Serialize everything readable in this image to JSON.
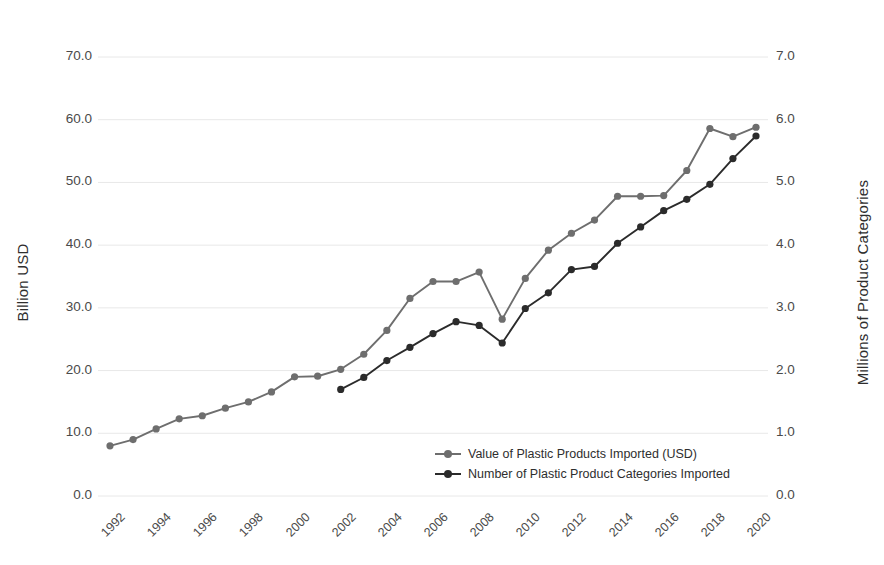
{
  "chart_data": {
    "type": "line",
    "title": "",
    "xlabel": "",
    "ylabel": "Billion USD",
    "y2label": "Millions of Product Categories",
    "grid": true,
    "legend_position": "inside-bottom-center",
    "x": [
      1992,
      1993,
      1994,
      1995,
      1996,
      1997,
      1998,
      1999,
      2000,
      2001,
      2002,
      2003,
      2004,
      2005,
      2006,
      2007,
      2008,
      2009,
      2010,
      2011,
      2012,
      2013,
      2014,
      2015,
      2016,
      2017,
      2018,
      2019,
      2020
    ],
    "xtick_labels": [
      "1992",
      "1994",
      "1996",
      "1998",
      "2000",
      "2002",
      "2004",
      "2006",
      "2008",
      "2010",
      "2012",
      "2014",
      "2016",
      "2018",
      "2020"
    ],
    "ytick_labels": [
      "0.0",
      "10.0",
      "20.0",
      "30.0",
      "40.0",
      "50.0",
      "60.0",
      "70.0"
    ],
    "y2tick_labels": [
      "0.0",
      "1.0",
      "2.0",
      "3.0",
      "4.0",
      "5.0",
      "6.0",
      "7.0"
    ],
    "ylim": [
      0,
      70
    ],
    "y2lim": [
      0,
      7
    ],
    "xlim": [
      1992,
      2020
    ],
    "series": [
      {
        "name": "Value of Plastic Products Imported (USD)",
        "axis": "left",
        "color": "#6e6e6e",
        "values": [
          8.0,
          9.0,
          10.7,
          12.3,
          12.8,
          14.0,
          15.0,
          16.6,
          19.0,
          19.1,
          20.2,
          22.6,
          26.4,
          31.5,
          34.2,
          34.2,
          35.7,
          28.2,
          34.7,
          39.2,
          41.9,
          44.0,
          47.8,
          47.8,
          47.9,
          51.9,
          58.6,
          57.3,
          58.8
        ]
      },
      {
        "name": "Number of Plastic Product Categories Imported",
        "axis": "right",
        "color": "#2b2b2b",
        "values": [
          null,
          null,
          null,
          null,
          null,
          null,
          null,
          null,
          null,
          null,
          1.7,
          1.89,
          2.16,
          2.37,
          2.59,
          2.78,
          2.72,
          2.44,
          2.99,
          3.24,
          3.61,
          3.66,
          4.03,
          4.29,
          4.55,
          4.73,
          4.97,
          5.38,
          5.74
        ]
      }
    ]
  },
  "axes": {
    "left_title": "Billion USD",
    "right_title": "Millions of Product Categories"
  },
  "legend": {
    "items": [
      {
        "label": "Value of Plastic Products Imported (USD)",
        "color": "#6e6e6e"
      },
      {
        "label": "Number of Plastic Product Categories Imported",
        "color": "#2b2b2b"
      }
    ]
  },
  "colors": {
    "series_value": "#6e6e6e",
    "series_count": "#2b2b2b",
    "grid": "#e8e8e8",
    "text": "#3a3a3a",
    "background": "#ffffff"
  }
}
